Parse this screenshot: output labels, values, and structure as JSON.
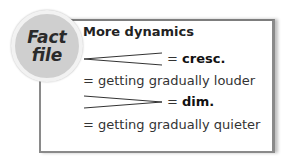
{
  "badge": {
    "line1": "Fact",
    "line2": "file"
  },
  "title": "More dynamics",
  "items": [
    {
      "symbol": "crescendo-hairpin",
      "equals": "=",
      "term": "cresc.",
      "meaning": "= getting gradually louder"
    },
    {
      "symbol": "diminuendo-hairpin",
      "equals": "=",
      "term": "dim.",
      "meaning": "= getting gradually quieter"
    }
  ]
}
